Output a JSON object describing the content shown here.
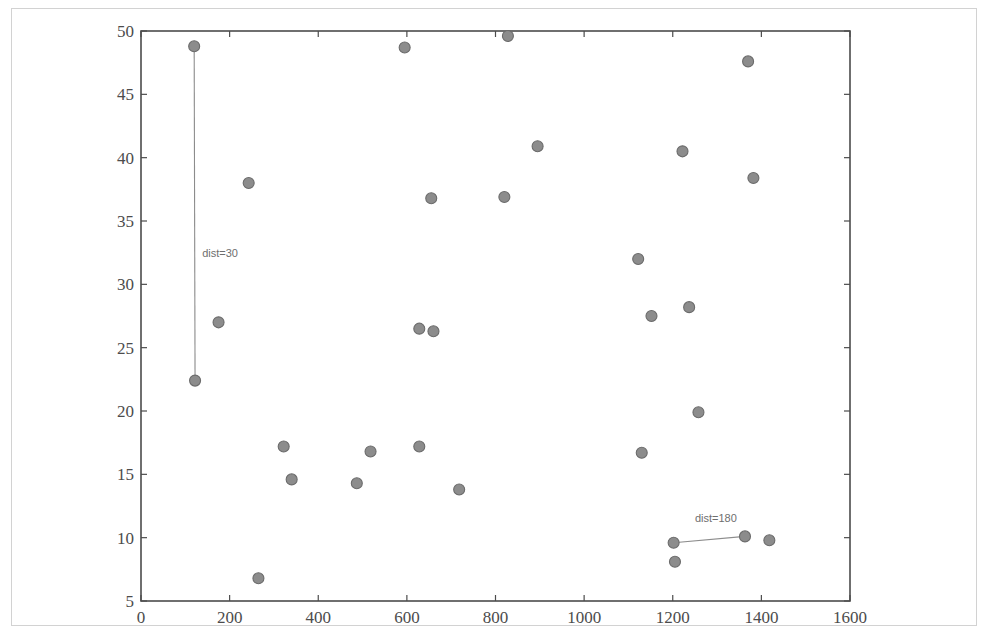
{
  "chart_data": {
    "type": "scatter",
    "title": "",
    "xlabel": "",
    "ylabel": "",
    "xlim": [
      0,
      1600
    ],
    "ylim": [
      5,
      50
    ],
    "xticks": [
      0,
      200,
      400,
      600,
      800,
      1000,
      1200,
      1400,
      1600
    ],
    "yticks": [
      5,
      10,
      15,
      20,
      25,
      30,
      35,
      40,
      45,
      50
    ],
    "xtick_labels": [
      "0",
      "200",
      "400",
      "600",
      "800",
      "1000",
      "1200",
      "1400",
      "1600"
    ],
    "ytick_labels": [
      "5",
      "10",
      "15",
      "20",
      "25",
      "30",
      "35",
      "40",
      "45",
      "50"
    ],
    "grid": false,
    "legend": null,
    "marker": {
      "shape": "circle",
      "face_color": "#8c8c8c",
      "edge_color": "#6b6b6b",
      "size_px": 11
    },
    "points": [
      {
        "x": 120,
        "y": 48.8
      },
      {
        "x": 175,
        "y": 27.0
      },
      {
        "x": 122,
        "y": 22.4
      },
      {
        "x": 243,
        "y": 38.0
      },
      {
        "x": 265,
        "y": 6.8
      },
      {
        "x": 322,
        "y": 17.2
      },
      {
        "x": 340,
        "y": 14.6
      },
      {
        "x": 487,
        "y": 14.3
      },
      {
        "x": 518,
        "y": 16.8
      },
      {
        "x": 595,
        "y": 48.7
      },
      {
        "x": 628,
        "y": 17.2
      },
      {
        "x": 628,
        "y": 26.5
      },
      {
        "x": 660,
        "y": 26.3
      },
      {
        "x": 655,
        "y": 36.8
      },
      {
        "x": 718,
        "y": 13.8
      },
      {
        "x": 820,
        "y": 36.9
      },
      {
        "x": 828,
        "y": 49.6
      },
      {
        "x": 895,
        "y": 40.9
      },
      {
        "x": 1122,
        "y": 32.0
      },
      {
        "x": 1130,
        "y": 16.7
      },
      {
        "x": 1152,
        "y": 27.5
      },
      {
        "x": 1202,
        "y": 9.6
      },
      {
        "x": 1205,
        "y": 8.1
      },
      {
        "x": 1222,
        "y": 40.5
      },
      {
        "x": 1237,
        "y": 28.2
      },
      {
        "x": 1258,
        "y": 19.9
      },
      {
        "x": 1363,
        "y": 10.1
      },
      {
        "x": 1370,
        "y": 47.6
      },
      {
        "x": 1382,
        "y": 38.4
      },
      {
        "x": 1418,
        "y": 9.8
      }
    ],
    "connections": [
      {
        "label": "dist=30",
        "from": {
          "x": 120,
          "y": 48.8
        },
        "to": {
          "x": 122,
          "y": 22.4
        },
        "label_position": {
          "x": 138,
          "y": 32.4
        }
      },
      {
        "label": "dist=180",
        "from": {
          "x": 1202,
          "y": 9.6
        },
        "to": {
          "x": 1363,
          "y": 10.1
        },
        "label_position": {
          "x": 1250,
          "y": 11.5
        }
      }
    ]
  },
  "figure": {
    "axes_color": "#4c4c4c",
    "outer_frame_color": "#d2d2d2",
    "background_color": "#ffffff",
    "annotation_color": "#6e6e6e",
    "line_color": "#8c8c8c"
  }
}
